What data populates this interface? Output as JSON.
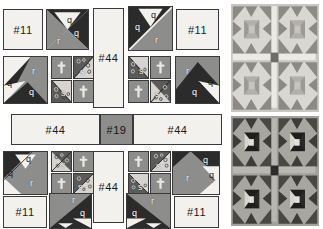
{
  "diagram": {
    "fabric_colors": {
      "light": "#f2f1ee",
      "medium": "#8d8d8c",
      "dark": "#2b2b2b",
      "outline": "#3a3a3a",
      "photo_background_light": "#cfcdc7",
      "photo_background_dark": "#9a9894"
    },
    "piece_labels": {
      "q": "q",
      "r": "r",
      "s": "s",
      "t": "t"
    },
    "patch_numbers": {
      "n11": "#11",
      "n19": "#19",
      "n44": "#44"
    },
    "rows": [
      {
        "name": "top-row",
        "units": [
          {
            "id": "tl-square-11",
            "label": "#11",
            "kind": "plain-light-square"
          },
          {
            "id": "tl-hourglass",
            "labels": [
              "q",
              "q",
              "r"
            ],
            "kind": "quarter-square-triangle"
          },
          {
            "id": "top-sash-44",
            "label": "#44",
            "kind": "vertical-sashing"
          },
          {
            "id": "tr-hourglass",
            "labels": [
              "q",
              "q",
              "r"
            ],
            "kind": "quarter-square-triangle-mirrored"
          },
          {
            "id": "tr-square-11",
            "label": "#11",
            "kind": "plain-light-square"
          }
        ]
      },
      {
        "name": "second-row",
        "units": [
          {
            "id": "l-hourglass",
            "labels": [
              "q",
              "q",
              "r"
            ],
            "kind": "quarter-square-triangle"
          },
          {
            "id": "l-fourpatch",
            "labels": [
              "t",
              "s",
              "s",
              "t"
            ],
            "kind": "four-patch-of-small-units"
          },
          {
            "id": "r-fourpatch",
            "labels": [
              "s",
              "t",
              "t",
              "s"
            ],
            "kind": "four-patch-of-small-units"
          },
          {
            "id": "r-hourglass",
            "labels": [
              "r",
              "q",
              "q"
            ],
            "kind": "quarter-square-triangle-mirrored"
          }
        ]
      },
      {
        "name": "center-sash-row",
        "units": [
          {
            "id": "center-left-44",
            "label": "#44",
            "kind": "horizontal-sashing"
          },
          {
            "id": "center-19",
            "label": "#19",
            "kind": "center-square"
          },
          {
            "id": "center-right-44",
            "label": "#44",
            "kind": "horizontal-sashing"
          }
        ]
      },
      {
        "name": "third-row",
        "units": [
          {
            "id": "bl-hourglass",
            "labels": [
              "q",
              "q",
              "r"
            ],
            "kind": "quarter-square-triangle"
          },
          {
            "id": "bl-fourpatch",
            "labels": [
              "s",
              "t",
              "t",
              "s"
            ],
            "kind": "four-patch-of-small-units"
          },
          {
            "id": "bottom-sash-44",
            "label": "#44",
            "kind": "vertical-sashing"
          },
          {
            "id": "br-fourpatch",
            "labels": [
              "t",
              "s",
              "s",
              "t"
            ],
            "kind": "four-patch-of-small-units"
          },
          {
            "id": "br-hourglass",
            "labels": [
              "q",
              "q",
              "r"
            ],
            "kind": "quarter-square-triangle-mirrored"
          }
        ]
      },
      {
        "name": "bottom-row",
        "units": [
          {
            "id": "bl-square-11",
            "label": "#11",
            "kind": "plain-light-square"
          },
          {
            "id": "bl-corner-hourglass",
            "labels": [
              "r",
              "q",
              "q"
            ],
            "kind": "quarter-square-triangle"
          },
          {
            "id": "br-corner-hourglass",
            "labels": [
              "q",
              "r",
              "q"
            ],
            "kind": "quarter-square-triangle-mirrored"
          },
          {
            "id": "br-square-11",
            "label": "#11",
            "kind": "plain-light-square"
          }
        ]
      }
    ]
  },
  "photos": [
    {
      "id": "finished-block-light",
      "caption": "",
      "colorway": "light",
      "pattern": "four sawtooth stars with sashing"
    },
    {
      "id": "finished-block-dark",
      "caption": "",
      "colorway": "dark",
      "pattern": "four sawtooth stars with sashing"
    }
  ]
}
